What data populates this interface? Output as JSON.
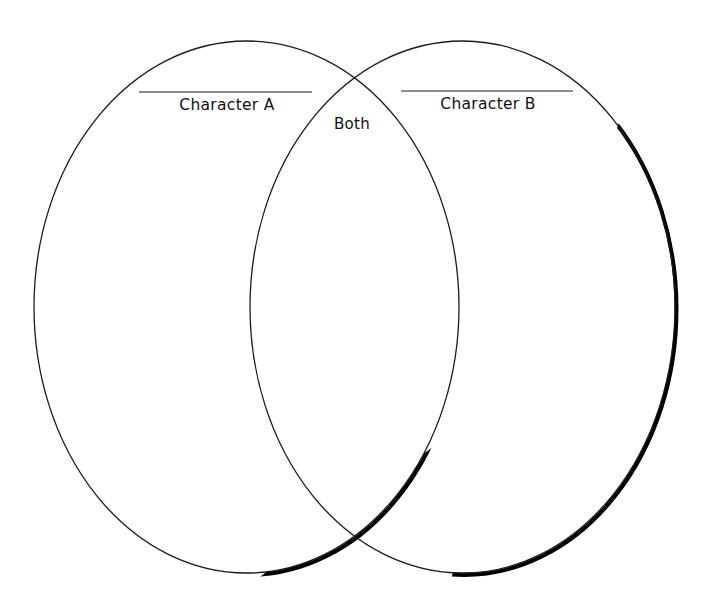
{
  "diagram": {
    "type": "venn",
    "sets": [
      {
        "id": "A",
        "label": "Character A",
        "shape": {
          "cx": 246.5,
          "cy": 307,
          "rx": 212.5,
          "ry": 266
        }
      },
      {
        "id": "B",
        "label": "Character B",
        "shape": {
          "cx": 462.5,
          "cy": 307,
          "rx": 212.5,
          "ry": 266
        }
      }
    ],
    "intersection": {
      "label": "Both"
    },
    "writing_lines": [
      {
        "for": "A",
        "x1": 139,
        "x2": 312,
        "y": 92
      },
      {
        "for": "B",
        "x1": 401,
        "x2": 573,
        "y": 91
      }
    ],
    "colors": {
      "outline": "#1a1a1a",
      "shadow": "#000000",
      "background": "#ffffff",
      "text": "#111111"
    }
  }
}
